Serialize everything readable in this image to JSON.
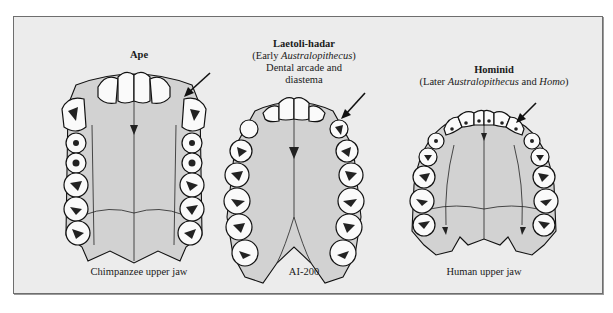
{
  "figure": {
    "panels": [
      {
        "id": "ape",
        "heading": "Ape",
        "subheading": [],
        "caption": "Chimpanzee upper jaw",
        "arrow": "points to diastema gap between canine and incisors"
      },
      {
        "id": "laetoli-hadar",
        "heading": "Laetoli-hadar",
        "subheading_parts": [
          {
            "text": "(Early ",
            "italic": false
          },
          {
            "text": "Australopithecus",
            "italic": true
          },
          {
            "text": ")",
            "italic": false
          }
        ],
        "subheading_lines": [
          "Dental arcade and",
          "diastema"
        ],
        "caption": "AI-200",
        "arrow": "points to diastema"
      },
      {
        "id": "hominid",
        "heading": "Hominid",
        "subheading_parts": [
          {
            "text": "(Later ",
            "italic": false
          },
          {
            "text": "Australopithecus",
            "italic": true
          },
          {
            "text": " and ",
            "italic": false
          },
          {
            "text": "Homo",
            "italic": true
          },
          {
            "text": ")",
            "italic": false
          }
        ],
        "caption": "Human upper jaw",
        "arrow": "points to canine in continuous parabolic arcade"
      }
    ],
    "labels": {
      "ape_heading": "Ape",
      "laetoli_heading": "Laetoli-hadar",
      "laetoli_sub_pre": "(Early ",
      "laetoli_sub_italic": "Australopithecus",
      "laetoli_sub_post": ")",
      "laetoli_line2": "Dental arcade and",
      "laetoli_line3": "diastema",
      "hominid_heading": "Hominid",
      "hominid_sub_pre": "(Later ",
      "hominid_sub_italic1": "Australopithecus",
      "hominid_sub_mid": " and ",
      "hominid_sub_italic2": "Homo",
      "hominid_sub_post": ")",
      "ape_caption": "Chimpanzee upper jaw",
      "laetoli_caption": "AI-200",
      "hominid_caption": "Human upper jaw"
    },
    "colors": {
      "background": "#ececec",
      "bone": "#d2d2d2",
      "tooth": "#fafafa",
      "ink": "#111111",
      "frame_border": "#6e6e6e"
    }
  }
}
